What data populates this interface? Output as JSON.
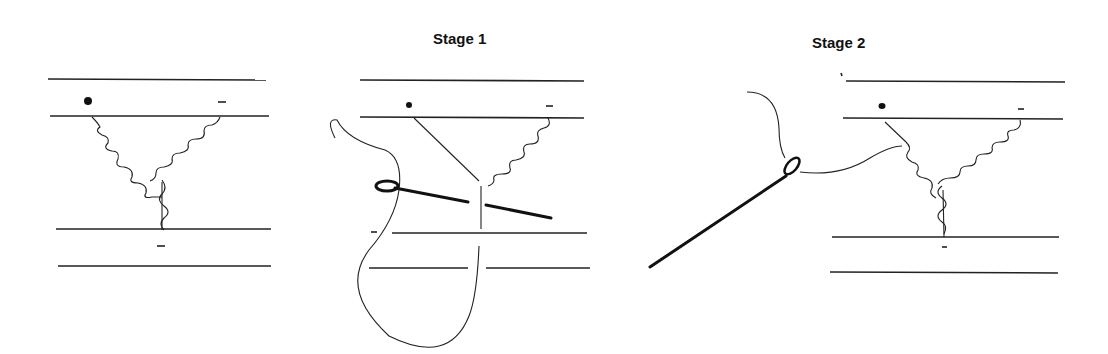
{
  "figure": {
    "panels": [
      {
        "id": "initial",
        "label": ""
      },
      {
        "id": "stage-1",
        "label": "Stage 1"
      },
      {
        "id": "stage-2",
        "label": "Stage 2"
      }
    ],
    "markers": {
      "dot": "●",
      "dash": "–"
    }
  }
}
